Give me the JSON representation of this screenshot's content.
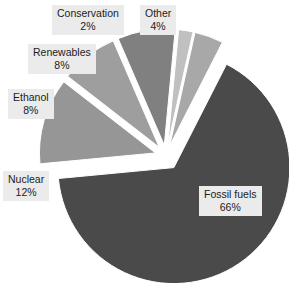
{
  "chart_data": {
    "type": "pie",
    "title": "",
    "subtitle": "",
    "xlabel": "",
    "ylabel": "",
    "legend_position": "none",
    "grid": false,
    "unit": "%",
    "total": 100,
    "categories": [
      "Fossil fuels",
      "Nuclear",
      "Ethanol",
      "Renewables",
      "Other",
      "Conservation"
    ],
    "values": [
      66,
      12,
      8,
      8,
      4,
      2
    ],
    "slices": [
      {
        "label": "Fossil fuels",
        "value": 66,
        "value_text": "66%",
        "color": "#4a4a4a",
        "start_angle_deg": -63,
        "end_angle_deg": 174.6,
        "explode": 14
      },
      {
        "label": "Nuclear",
        "value": 12,
        "value_text": "12%",
        "color": "#969696",
        "start_angle_deg": 174.6,
        "end_angle_deg": 217.8,
        "explode": 11
      },
      {
        "label": "Ethanol",
        "value": 8,
        "value_text": "8%",
        "color": "#9e9e9e",
        "start_angle_deg": 217.8,
        "end_angle_deg": 246.6,
        "explode": 11
      },
      {
        "label": "Renewables",
        "value": 8,
        "value_text": "8%",
        "color": "#808080",
        "start_angle_deg": 246.6,
        "end_angle_deg": 275.4,
        "explode": 11
      },
      {
        "label": "Conservation",
        "value": 2,
        "value_text": "2%",
        "color": "#c0c0c0",
        "start_angle_deg": 275.4,
        "end_angle_deg": 282.6,
        "explode": 11
      },
      {
        "label": "Other",
        "value": 4,
        "value_text": "4%",
        "color": "#a8a8a8",
        "start_angle_deg": 282.6,
        "end_angle_deg": 297,
        "explode": 11
      }
    ]
  },
  "callouts": {
    "conservation": {
      "name": "Conservation",
      "value": "2%"
    },
    "other": {
      "name": "Other",
      "value": "4%"
    },
    "renewables": {
      "name": "Renewables",
      "value": "8%"
    },
    "ethanol": {
      "name": "Ethanol",
      "value": "8%"
    },
    "nuclear": {
      "name": "Nuclear",
      "value": "12%"
    },
    "fossil": {
      "name": "Fossil fuels",
      "value": "66%"
    }
  },
  "style": {
    "background": "#ffffff",
    "callout_background": "#ebebeb",
    "callout_text": "#1c1c1c"
  }
}
